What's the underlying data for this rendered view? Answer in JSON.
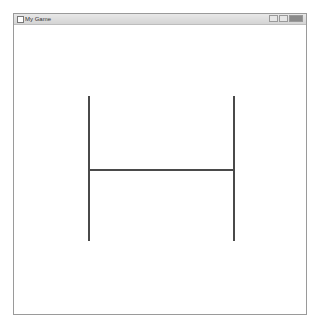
{
  "window": {
    "title": "My Game",
    "controls": [
      "minimize",
      "maximize",
      "close"
    ]
  },
  "canvas": {
    "shape": "H",
    "lines": [
      {
        "name": "left-vertical",
        "x1": 88,
        "y1": 96,
        "x2": 88,
        "y2": 241
      },
      {
        "name": "right-vertical",
        "x1": 233,
        "y1": 96,
        "x2": 233,
        "y2": 241
      },
      {
        "name": "crossbar",
        "x1": 88,
        "y1": 169,
        "x2": 233,
        "y2": 169
      }
    ],
    "line_color": "#4a4a4a"
  }
}
